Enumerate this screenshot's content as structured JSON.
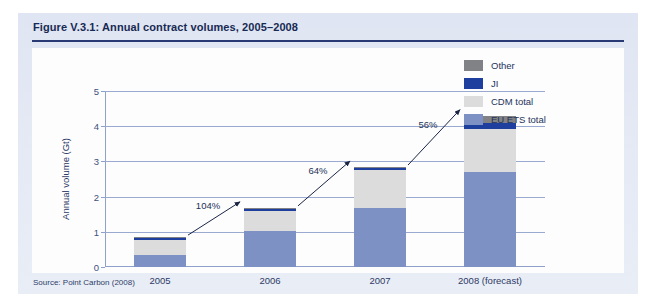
{
  "figure": {
    "title": "Figure V.3.1: Annual contract volumes, 2005–2008",
    "source": "Source: Point Carbon (2008)"
  },
  "legend": {
    "position": "top-right",
    "items": [
      {
        "label": "Other",
        "color": "#808285"
      },
      {
        "label": "JI",
        "color": "#1f3f9e"
      },
      {
        "label": "CDM total",
        "color": "#dcdcdc"
      },
      {
        "label": "EU ETS total",
        "color": "#7d91c4"
      }
    ]
  },
  "chart_data": {
    "type": "bar",
    "stacked": true,
    "title": "Figure V.3.1: Annual contract volumes, 2005–2008",
    "xlabel": "",
    "ylabel": "Annual volume (Gt)",
    "ylim": [
      0,
      5
    ],
    "yticks": [
      0,
      1,
      2,
      3,
      4,
      5
    ],
    "ytick_labels": [
      "0",
      "1",
      "2",
      "3",
      "4",
      "5"
    ],
    "grid": true,
    "categories": [
      "2005",
      "2006",
      "2007",
      "2008 (forecast)"
    ],
    "series": [
      {
        "name": "EU ETS total",
        "color": "#7d91c4",
        "values": [
          0.35,
          1.02,
          1.68,
          2.7
        ]
      },
      {
        "name": "CDM total",
        "color": "#dcdcdc",
        "values": [
          0.43,
          0.56,
          1.07,
          1.22
        ]
      },
      {
        "name": "JI",
        "color": "#1f3f9e",
        "values": [
          0.05,
          0.07,
          0.06,
          0.17
        ]
      },
      {
        "name": "Other",
        "color": "#808285",
        "values": [
          0.02,
          0.03,
          0.03,
          0.21
        ]
      }
    ],
    "totals": [
      0.85,
      1.68,
      2.84,
      4.3
    ],
    "annotations": [
      {
        "text": "104%",
        "from": "2005",
        "to": "2006"
      },
      {
        "text": "64%",
        "from": "2006",
        "to": "2007"
      },
      {
        "text": "56%",
        "from": "2007",
        "to": "2008 (forecast)"
      }
    ]
  }
}
